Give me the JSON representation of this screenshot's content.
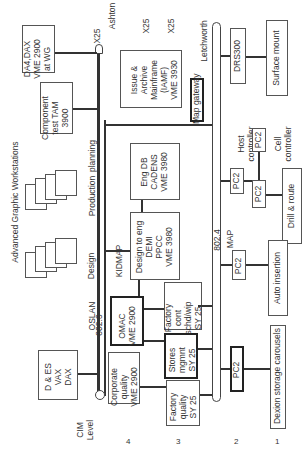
{
  "cim_level_label": "CIM\nLevel",
  "levels": [
    "4",
    "3",
    "2",
    "1"
  ],
  "workstations_label": "Advanced Graphic Workstations",
  "networks": {
    "oslan": "OSLAN",
    "oslan_std": "802.3",
    "map": "MAP",
    "map_std": "802.4",
    "kidmap": "KIDMAP",
    "ashton": "Ashton",
    "letchworth": "Letchworth",
    "x25_1": "X25",
    "x25_2": "X25",
    "x25_3": "X25"
  },
  "workstation_groups": {
    "design": "Design",
    "production": "Production",
    "planning": "planning"
  },
  "boxes": {
    "da4": "DA4,DAX\nVME 2900\nat WG",
    "component_test": "Component\ntest TAM\n3900",
    "issue_archive": "Issue &\nArchive\nMainframe\n(IAMF)\nVME 3930",
    "map_gateway": "Map gateway",
    "eng_db": "Eng DB\nCADENS\nVME 3980",
    "design_to_eng": "Design to eng\nDEMI\nPPCC\nVME 3980",
    "d_es": "D & ES\nVAX\nDAX",
    "corporate_quality": "Corporate\nquality\nVME 2900",
    "omac": "OMAC\nVME 2900",
    "factory_cont": "Factory\ncont\nschd/wip\nSY 25",
    "stores_mgmt": "Stores\nmgmnt\nSY 25",
    "factory_quality": "Factory\nquality\nSY 25",
    "drs300": "DRS300",
    "host_controller": "Host\ncontroller",
    "cell_controller": "Cell\ncontroller",
    "pc2_host": "PC2",
    "pc2_cellupper": "PC2",
    "pc2_cell": "PC2",
    "pc2_auto": "PC2",
    "pc2_dexion": "PC2",
    "surface_mount": "Surface mount",
    "drill_route": "Drill & route",
    "auto_insertion": "Auto insertion",
    "dexion": "Dexion storage carousels"
  }
}
